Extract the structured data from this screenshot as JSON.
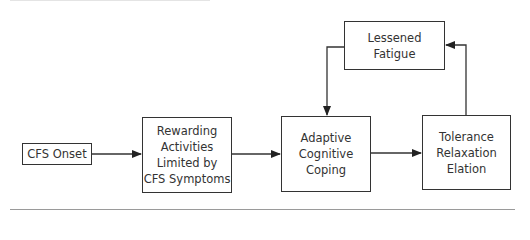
{
  "diagram": {
    "nodes": [
      {
        "id": "cfs_onset",
        "lines": [
          "CFS Onset"
        ]
      },
      {
        "id": "rewarding",
        "lines": [
          "Rewarding",
          "Activities",
          "Limited by",
          "CFS Symptoms"
        ]
      },
      {
        "id": "adaptive",
        "lines": [
          "Adaptive",
          "Cognitive",
          "Coping"
        ]
      },
      {
        "id": "tolerance",
        "lines": [
          "Tolerance",
          "Relaxation",
          "Elation"
        ]
      },
      {
        "id": "lessened",
        "lines": [
          "Lessened",
          "Fatigue"
        ]
      }
    ],
    "edges": [
      {
        "from": "cfs_onset",
        "to": "rewarding"
      },
      {
        "from": "rewarding",
        "to": "adaptive"
      },
      {
        "from": "adaptive",
        "to": "tolerance"
      },
      {
        "from": "tolerance",
        "to": "lessened"
      },
      {
        "from": "lessened",
        "to": "adaptive"
      }
    ],
    "colors": {
      "stroke": "#333333",
      "background": "#ffffff"
    }
  }
}
